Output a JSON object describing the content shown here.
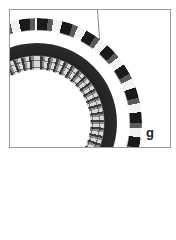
{
  "figure": {
    "panel_label": "g",
    "colors": {
      "border": "#9a9a9a",
      "background": "#ffffff",
      "beads_dark": "#1a1a1a",
      "beads_light": "#d9d9d9"
    }
  }
}
